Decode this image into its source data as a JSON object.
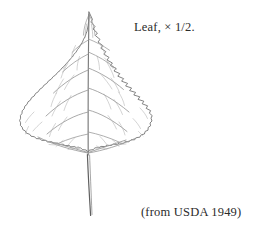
{
  "figure": {
    "illustration_style": "botanical-line-drawing",
    "leaf": {
      "shape": "deltoid-triangular",
      "margin": "serrate-crenate",
      "apex": "acuminate",
      "base": "truncate",
      "venation": "pinnate",
      "petiole": "long-slender"
    },
    "colors": {
      "background": "#ffffff",
      "ink": "#8a8a8a",
      "outline_ink": "#6e6e6e",
      "vein_ink": "#9a9a9a",
      "petiole_ink": "#5f5f5f",
      "text": "#2b2b2b"
    }
  },
  "captions": {
    "scale": "Leaf, × 1/2.",
    "source": "(from USDA 1949)"
  }
}
